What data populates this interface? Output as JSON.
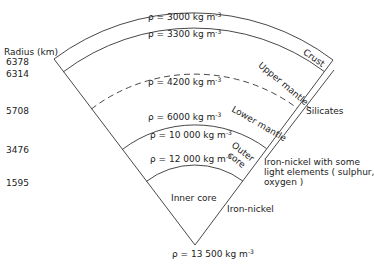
{
  "radius_axis": {
    "title": "Radius (km)",
    "ticks": [
      "6378",
      "6314",
      "5708",
      "3476",
      "1595"
    ]
  },
  "densities": [
    {
      "rho": "ρ = 3000 kg m",
      "exp": "-3"
    },
    {
      "rho": "ρ = 3300 kg m",
      "exp": "-3"
    },
    {
      "rho": "ρ = 4200 kg m",
      "exp": "-3"
    },
    {
      "rho": "ρ = 6000 kg m",
      "exp": "-3"
    },
    {
      "rho": "ρ = 10 000 kg m",
      "exp": "-3"
    },
    {
      "rho": "ρ = 12 000 kg m",
      "exp": "-3"
    },
    {
      "rho": "ρ = 13 500 kg m",
      "exp": "-3"
    }
  ],
  "layers": {
    "crust": "Crust",
    "upper_mantle": "Upper mantle",
    "lower_mantle": "Lower mantle",
    "outer_core_1": "Outer",
    "outer_core_2": "core",
    "inner_core": "Inner core"
  },
  "composition": {
    "silicates": "Silicates",
    "outer_core_line1": "Iron-nickel with some",
    "outer_core_line2": "light elements ( sulphur,",
    "outer_core_line3": "oxygen )",
    "inner_core": "Iron-nickel"
  }
}
